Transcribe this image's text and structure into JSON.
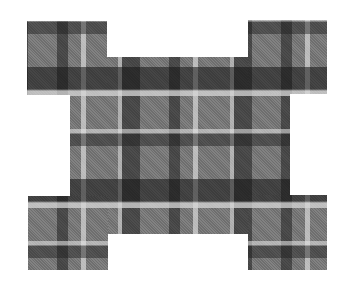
{
  "image": {
    "description": "Gray tartan plaid fabric cut into a cross-like shape with four square tabs at the corners",
    "palette": {
      "base": "#7a7a7a",
      "dark_stripe": "#2a2a2a",
      "light_stripe": "#d4d4d4",
      "background": "#ffffff"
    },
    "parts": [
      {
        "id": "center",
        "label": "center-panel"
      },
      {
        "id": "tl",
        "label": "top-left-tab"
      },
      {
        "id": "tr",
        "label": "top-right-tab"
      },
      {
        "id": "bl",
        "label": "bottom-left-tab"
      },
      {
        "id": "br",
        "label": "bottom-right-tab"
      }
    ]
  }
}
